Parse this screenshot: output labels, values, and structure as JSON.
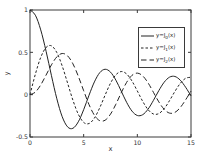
{
  "figure": {
    "background": "#ffffff",
    "axis_color": "#3a3a3a",
    "curve_color": "#222222",
    "x_tick_labels": [
      "0",
      "5",
      "10",
      "15"
    ],
    "y_tick_labels": [
      "1",
      "0.5",
      "0",
      "-0.5"
    ]
  },
  "legend": {
    "items": [
      {
        "prefix": "y=J",
        "sub": "0",
        "suffix": "(x)",
        "style": "solid"
      },
      {
        "prefix": "y=J",
        "sub": "1",
        "suffix": "(x)",
        "style": "dashed"
      },
      {
        "prefix": "y=J",
        "sub": "2",
        "suffix": "(x)",
        "style": "long-dashed"
      }
    ]
  },
  "chart_data": {
    "type": "line",
    "title": "",
    "xlabel": "x",
    "ylabel": "y",
    "xlim": [
      0,
      15
    ],
    "ylim": [
      -0.5,
      1
    ],
    "x_ticks": [
      0,
      5,
      10,
      15
    ],
    "y_ticks": [
      -0.5,
      0,
      0.5,
      1
    ],
    "grid": false,
    "legend_position": "upper right",
    "x": [
      0,
      0.5,
      1,
      1.5,
      2,
      2.5,
      3,
      3.5,
      4,
      4.5,
      5,
      5.5,
      6,
      6.5,
      7,
      7.5,
      8,
      8.5,
      9,
      9.5,
      10,
      10.5,
      11,
      11.5,
      12,
      12.5,
      13,
      13.5,
      14,
      14.5,
      15
    ],
    "series": [
      {
        "name": "y=J0(x)",
        "style": "solid",
        "color": "#222222",
        "values": [
          1,
          0.9385,
          0.7652,
          0.5118,
          0.2239,
          -0.0484,
          -0.2601,
          -0.3801,
          -0.3971,
          -0.3205,
          -0.1776,
          -0.0068,
          0.1506,
          0.2601,
          0.3001,
          0.2663,
          0.1717,
          0.0419,
          -0.0903,
          -0.1939,
          -0.2459,
          -0.2366,
          -0.1712,
          -0.0677,
          0.0477,
          0.1469,
          0.2069,
          0.215,
          0.1711,
          0.0875,
          -0.0142
        ]
      },
      {
        "name": "y=J1(x)",
        "style": "dashed",
        "color": "#222222",
        "values": [
          0,
          0.2423,
          0.4401,
          0.5579,
          0.5767,
          0.4971,
          0.3391,
          0.1374,
          -0.066,
          -0.2311,
          -0.3276,
          -0.3414,
          -0.2767,
          -0.1538,
          -0.0047,
          0.1352,
          0.2346,
          0.2731,
          0.2453,
          0.1613,
          0.0435,
          -0.0789,
          -0.1768,
          -0.2284,
          -0.2234,
          -0.1655,
          -0.0703,
          0.038,
          0.1334,
          0.1934,
          0.2051
        ]
      },
      {
        "name": "y=J2(x)",
        "style": "long-dashed",
        "color": "#222222",
        "values": [
          0,
          0.0306,
          0.1149,
          0.2321,
          0.3528,
          0.4461,
          0.4861,
          0.4586,
          0.3641,
          0.2178,
          0.0466,
          -0.1173,
          -0.2429,
          -0.3074,
          -0.3014,
          -0.2303,
          -0.113,
          0.0223,
          0.1448,
          0.2279,
          0.2546,
          0.2216,
          0.139,
          0.028,
          -0.0849,
          -0.1734,
          -0.2177,
          -0.2094,
          -0.152,
          -0.0608,
          0.0415
        ]
      }
    ]
  }
}
